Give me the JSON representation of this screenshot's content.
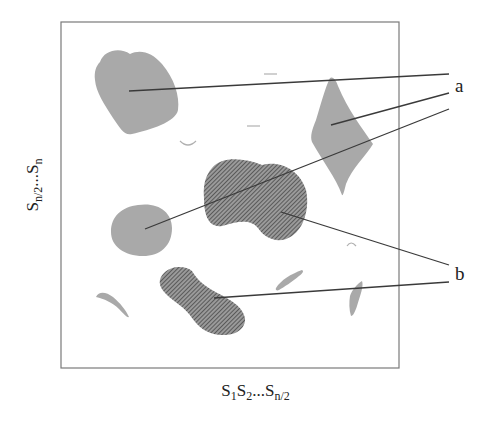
{
  "figure": {
    "x_axis_label": {
      "main": "S",
      "parts": [
        {
          "base": "S",
          "sub": "1"
        },
        {
          "base": "S",
          "sub": "2"
        },
        {
          "base": "...S",
          "sub": "n/2"
        }
      ]
    },
    "y_axis_label": {
      "parts": [
        {
          "base": "S",
          "sub": "n/2"
        },
        {
          "base": "...S",
          "sub": "n"
        }
      ]
    },
    "callouts": [
      {
        "label": "a",
        "meaning": "light gray regions"
      },
      {
        "label": "b",
        "meaning": "hatched dark regions"
      }
    ],
    "colors": {
      "frame": "#777777",
      "region_a_fill": "#a9a9a9",
      "region_b_hatch": "#555555",
      "leader_line": "#3a3a3a"
    }
  }
}
